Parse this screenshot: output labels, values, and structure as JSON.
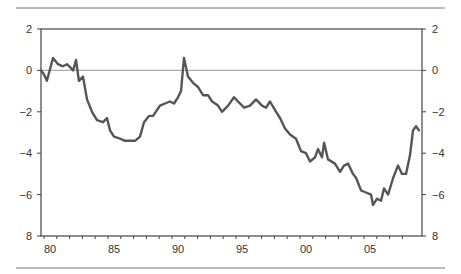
{
  "chart_data": {
    "type": "line",
    "title": "",
    "xlabel": "",
    "ylabel": "",
    "xlim": [
      1979.77,
      2008.83
    ],
    "ylim": [
      -8,
      2
    ],
    "y_tick_labels": [
      "2",
      "0",
      "-2",
      "-4",
      "-6",
      "8"
    ],
    "y_tick_values": [
      2,
      0,
      -2,
      -4,
      -6,
      -8
    ],
    "x_tick_labels": [
      "80",
      "85",
      "90",
      "95",
      "00",
      "05"
    ],
    "x_tick_values": [
      1980,
      1985,
      1990,
      1995,
      2000,
      2005
    ],
    "grid": false,
    "reference_line": 0,
    "legend": null,
    "series": [
      {
        "name": "series",
        "x": [
          1979.77,
          1980.0,
          1980.23,
          1980.7,
          1981.09,
          1981.48,
          1981.8,
          1982.27,
          1982.5,
          1982.73,
          1983.05,
          1983.36,
          1983.75,
          1984.14,
          1984.61,
          1984.92,
          1985.16,
          1985.47,
          1985.94,
          1986.33,
          1987.11,
          1987.5,
          1987.81,
          1988.2,
          1988.52,
          1989.06,
          1989.45,
          1989.84,
          1990.16,
          1990.47,
          1990.7,
          1990.94,
          1991.25,
          1991.64,
          1992.03,
          1992.42,
          1992.81,
          1993.13,
          1993.59,
          1993.91,
          1994.38,
          1994.84,
          1995.31,
          1995.63,
          1996.09,
          1996.56,
          1997.03,
          1997.34,
          1997.66,
          1998.13,
          1998.44,
          1998.83,
          1999.22,
          1999.69,
          2000.08,
          2000.47,
          2000.78,
          2001.17,
          2001.41,
          2001.72,
          2001.88,
          2002.19,
          2002.73,
          2003.13,
          2003.44,
          2003.75,
          2004.14,
          2004.38,
          2004.77,
          2005.16,
          2005.55,
          2005.7,
          2006.02,
          2006.33,
          2006.56,
          2006.88,
          2007.27,
          2007.66,
          2007.97,
          2008.28,
          2008.59,
          2008.83,
          2009.06,
          2009.3
        ],
        "values": [
          0.0,
          -0.2,
          -0.5,
          0.6,
          0.3,
          0.2,
          0.3,
          0.0,
          0.5,
          -0.5,
          -0.3,
          -1.4,
          -2.0,
          -2.4,
          -2.5,
          -2.3,
          -2.9,
          -3.2,
          -3.3,
          -3.4,
          -3.4,
          -3.2,
          -2.5,
          -2.2,
          -2.2,
          -1.7,
          -1.6,
          -1.5,
          -1.6,
          -1.3,
          -1.0,
          0.6,
          -0.3,
          -0.6,
          -0.8,
          -1.2,
          -1.2,
          -1.5,
          -1.7,
          -2.0,
          -1.7,
          -1.3,
          -1.6,
          -1.8,
          -1.7,
          -1.4,
          -1.7,
          -1.8,
          -1.5,
          -2.0,
          -2.3,
          -2.8,
          -3.1,
          -3.3,
          -3.9,
          -4.0,
          -4.4,
          -4.2,
          -3.8,
          -4.2,
          -3.5,
          -4.3,
          -4.5,
          -4.9,
          -4.6,
          -4.5,
          -5.0,
          -5.2,
          -5.8,
          -5.9,
          -6.0,
          -6.5,
          -6.2,
          -6.3,
          -5.7,
          -6.0,
          -5.2,
          -4.6,
          -5.0,
          -5.0,
          -4.1,
          -2.9,
          -2.7,
          -2.9
        ]
      }
    ]
  },
  "layout": {
    "line_color": "#555555",
    "frame_color": "#444444",
    "zero_line_color": "#aaaaaa",
    "rule_color": "#777777"
  }
}
